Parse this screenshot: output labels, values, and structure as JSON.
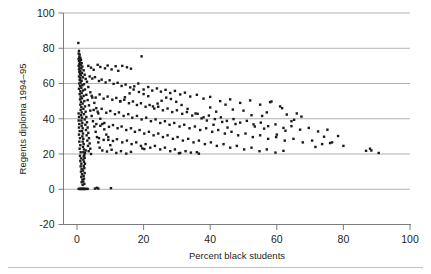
{
  "chart_data": {
    "type": "scatter",
    "title": "",
    "subtitle": "",
    "xlabel": "Percent black students",
    "ylabel": "Regents diploma 1994–95",
    "xlim": [
      -4,
      100
    ],
    "ylim": [
      -20,
      100
    ],
    "xticks": [
      0,
      20,
      40,
      60,
      80,
      100
    ],
    "yticks": [
      -20,
      0,
      20,
      40,
      60,
      80,
      100
    ],
    "xtick_labels": [
      "0",
      "20",
      "40",
      "60",
      "80",
      "100"
    ],
    "ytick_labels": [
      "-20",
      "0",
      "20",
      "40",
      "60",
      "80",
      "100"
    ],
    "gridlines_y": [
      0,
      20,
      40,
      60,
      80,
      100
    ],
    "grid": "horizontal",
    "legend": "none",
    "marker": "square",
    "marker_color": "#1a1a1a",
    "marker_size": 2.4,
    "n_points": 438,
    "points": [
      [
        0.4,
        83.0
      ],
      [
        0.6,
        78.5
      ],
      [
        0.5,
        77.0
      ],
      [
        0.8,
        76.4
      ],
      [
        0.7,
        75.2
      ],
      [
        1.0,
        74.6
      ],
      [
        0.5,
        74.0
      ],
      [
        1.2,
        73.4
      ],
      [
        0.6,
        72.8
      ],
      [
        0.9,
        72.0
      ],
      [
        1.4,
        71.5
      ],
      [
        0.7,
        71.0
      ],
      [
        1.1,
        70.4
      ],
      [
        0.5,
        70.0
      ],
      [
        1.6,
        69.6
      ],
      [
        0.8,
        69.0
      ],
      [
        1.3,
        68.5
      ],
      [
        0.6,
        68.0
      ],
      [
        2.0,
        67.5
      ],
      [
        1.0,
        67.0
      ],
      [
        0.7,
        66.6
      ],
      [
        1.5,
        66.0
      ],
      [
        0.9,
        65.5
      ],
      [
        2.3,
        65.0
      ],
      [
        1.2,
        64.6
      ],
      [
        0.6,
        64.0
      ],
      [
        1.8,
        63.5
      ],
      [
        1.0,
        63.0
      ],
      [
        2.6,
        62.6
      ],
      [
        0.8,
        62.0
      ],
      [
        1.4,
        61.6
      ],
      [
        3.0,
        61.0
      ],
      [
        1.1,
        60.6
      ],
      [
        0.7,
        60.0
      ],
      [
        2.1,
        59.6
      ],
      [
        1.6,
        59.0
      ],
      [
        0.9,
        58.6
      ],
      [
        3.4,
        58.0
      ],
      [
        1.3,
        57.6
      ],
      [
        0.6,
        57.0
      ],
      [
        2.4,
        56.6
      ],
      [
        1.8,
        56.0
      ],
      [
        1.0,
        55.6
      ],
      [
        4.0,
        55.0
      ],
      [
        1.4,
        54.6
      ],
      [
        0.8,
        54.0
      ],
      [
        2.8,
        53.6
      ],
      [
        2.0,
        53.0
      ],
      [
        1.1,
        52.6
      ],
      [
        4.6,
        52.0
      ],
      [
        1.5,
        51.6
      ],
      [
        0.9,
        51.0
      ],
      [
        3.2,
        50.6
      ],
      [
        2.2,
        50.0
      ],
      [
        1.2,
        49.6
      ],
      [
        5.2,
        49.0
      ],
      [
        1.7,
        48.6
      ],
      [
        1.0,
        48.0
      ],
      [
        3.6,
        47.6
      ],
      [
        2.4,
        47.0
      ],
      [
        1.3,
        46.6
      ],
      [
        5.8,
        46.0
      ],
      [
        1.9,
        45.6
      ],
      [
        1.1,
        45.0
      ],
      [
        4.0,
        44.6
      ],
      [
        2.6,
        44.0
      ],
      [
        1.4,
        43.6
      ],
      [
        6.4,
        43.0
      ],
      [
        2.1,
        42.6
      ],
      [
        1.2,
        42.0
      ],
      [
        4.4,
        41.6
      ],
      [
        2.8,
        41.0
      ],
      [
        1.5,
        40.6
      ],
      [
        7.0,
        40.0
      ],
      [
        2.3,
        39.6
      ],
      [
        1.3,
        39.0
      ],
      [
        4.8,
        38.6
      ],
      [
        3.0,
        38.0
      ],
      [
        1.6,
        37.6
      ],
      [
        7.6,
        37.0
      ],
      [
        2.5,
        36.6
      ],
      [
        1.4,
        36.0
      ],
      [
        5.2,
        35.6
      ],
      [
        3.2,
        35.0
      ],
      [
        1.7,
        34.6
      ],
      [
        8.2,
        34.0
      ],
      [
        2.7,
        33.6
      ],
      [
        1.5,
        33.0
      ],
      [
        5.6,
        32.6
      ],
      [
        3.4,
        32.0
      ],
      [
        1.8,
        31.6
      ],
      [
        8.8,
        31.0
      ],
      [
        2.9,
        30.6
      ],
      [
        1.6,
        30.0
      ],
      [
        6.0,
        29.6
      ],
      [
        3.6,
        29.0
      ],
      [
        1.9,
        28.6
      ],
      [
        9.4,
        28.0
      ],
      [
        3.1,
        27.6
      ],
      [
        1.7,
        27.0
      ],
      [
        6.4,
        26.6
      ],
      [
        3.8,
        26.0
      ],
      [
        2.0,
        25.6
      ],
      [
        10.0,
        25.0
      ],
      [
        3.3,
        24.6
      ],
      [
        1.8,
        24.0
      ],
      [
        6.8,
        23.6
      ],
      [
        4.0,
        23.0
      ],
      [
        2.1,
        22.6
      ],
      [
        2.6,
        22.0
      ],
      [
        3.5,
        21.6
      ],
      [
        1.9,
        21.0
      ],
      [
        2.4,
        20.6
      ],
      [
        4.2,
        20.0
      ],
      [
        2.2,
        19.4
      ],
      [
        2.0,
        18.6
      ],
      [
        2.3,
        17.8
      ],
      [
        1.9,
        16.8
      ],
      [
        2.1,
        15.6
      ],
      [
        2.4,
        14.4
      ],
      [
        2.0,
        13.2
      ],
      [
        2.2,
        12.0
      ],
      [
        1.8,
        10.6
      ],
      [
        2.3,
        9.2
      ],
      [
        2.0,
        7.6
      ],
      [
        2.1,
        6.0
      ],
      [
        1.9,
        4.4
      ],
      [
        2.2,
        3.0
      ],
      [
        0.8,
        0.2
      ],
      [
        1.2,
        0.2
      ],
      [
        1.6,
        0.2
      ],
      [
        2.0,
        0.2
      ],
      [
        2.4,
        0.2
      ],
      [
        2.8,
        0.2
      ],
      [
        3.2,
        0.2
      ],
      [
        5.4,
        0.4
      ],
      [
        6.0,
        0.8
      ],
      [
        6.4,
        0.4
      ],
      [
        10.2,
        0.6
      ],
      [
        0.5,
        0.2
      ],
      [
        1.0,
        0.2
      ],
      [
        1.4,
        0.2
      ],
      [
        1.8,
        0.2
      ],
      [
        2.2,
        0.2
      ],
      [
        0.5,
        43.0
      ],
      [
        0.6,
        41.0
      ],
      [
        0.5,
        39.0
      ],
      [
        0.7,
        37.0
      ],
      [
        0.6,
        35.0
      ],
      [
        0.8,
        33.0
      ],
      [
        0.6,
        31.0
      ],
      [
        0.9,
        29.0
      ],
      [
        0.7,
        27.0
      ],
      [
        1.0,
        25.0
      ],
      [
        0.8,
        23.0
      ],
      [
        1.1,
        21.0
      ],
      [
        0.9,
        19.0
      ],
      [
        1.2,
        17.5
      ],
      [
        1.0,
        16.0
      ],
      [
        1.3,
        14.5
      ],
      [
        1.1,
        13.0
      ],
      [
        1.4,
        11.5
      ],
      [
        1.2,
        10.0
      ],
      [
        1.5,
        8.5
      ],
      [
        1.3,
        7.0
      ],
      [
        1.6,
        5.5
      ],
      [
        1.4,
        4.0
      ],
      [
        1.7,
        2.5
      ],
      [
        3.4,
        70.0
      ],
      [
        4.2,
        69.0
      ],
      [
        5.0,
        67.8
      ],
      [
        6.2,
        70.6
      ],
      [
        7.0,
        69.4
      ],
      [
        8.4,
        68.6
      ],
      [
        9.2,
        70.2
      ],
      [
        10.4,
        68.0
      ],
      [
        11.6,
        69.8
      ],
      [
        12.4,
        67.2
      ],
      [
        13.6,
        70.0
      ],
      [
        15.0,
        69.2
      ],
      [
        16.2,
        68.4
      ],
      [
        19.4,
        75.4
      ],
      [
        3.8,
        64.0
      ],
      [
        4.6,
        62.8
      ],
      [
        5.4,
        63.6
      ],
      [
        6.6,
        61.4
      ],
      [
        7.4,
        62.2
      ],
      [
        8.6,
        60.6
      ],
      [
        9.8,
        61.8
      ],
      [
        11.0,
        59.8
      ],
      [
        12.2,
        60.4
      ],
      [
        13.4,
        58.6
      ],
      [
        14.6,
        59.4
      ],
      [
        16.0,
        57.8
      ],
      [
        17.2,
        58.4
      ],
      [
        18.4,
        60.0
      ],
      [
        20.0,
        56.6
      ],
      [
        21.4,
        58.0
      ],
      [
        22.6,
        56.0
      ],
      [
        24.0,
        57.2
      ],
      [
        25.2,
        55.4
      ],
      [
        26.6,
        56.4
      ],
      [
        28.0,
        54.6
      ],
      [
        29.4,
        55.8
      ],
      [
        31.0,
        53.8
      ],
      [
        32.4,
        54.8
      ],
      [
        34.0,
        52.6
      ],
      [
        36.0,
        53.6
      ],
      [
        38.0,
        51.4
      ],
      [
        40.0,
        52.4
      ],
      [
        43.0,
        50.0
      ],
      [
        46.0,
        51.0
      ],
      [
        49.0,
        49.0
      ],
      [
        52.0,
        50.4
      ],
      [
        55.0,
        48.0
      ],
      [
        58.0,
        49.4
      ],
      [
        61.0,
        47.0
      ],
      [
        4.4,
        53.0
      ],
      [
        5.6,
        52.0
      ],
      [
        6.8,
        53.8
      ],
      [
        8.0,
        51.4
      ],
      [
        9.2,
        52.6
      ],
      [
        10.6,
        50.8
      ],
      [
        11.8,
        51.8
      ],
      [
        13.0,
        49.8
      ],
      [
        14.2,
        50.8
      ],
      [
        15.6,
        48.8
      ],
      [
        16.8,
        49.8
      ],
      [
        18.0,
        47.8
      ],
      [
        19.2,
        48.8
      ],
      [
        20.6,
        46.8
      ],
      [
        21.8,
        47.8
      ],
      [
        23.2,
        45.8
      ],
      [
        24.4,
        46.8
      ],
      [
        25.8,
        44.8
      ],
      [
        27.2,
        45.8
      ],
      [
        28.6,
        43.8
      ],
      [
        30.0,
        44.8
      ],
      [
        31.6,
        42.8
      ],
      [
        33.0,
        43.8
      ],
      [
        34.6,
        41.8
      ],
      [
        36.2,
        42.8
      ],
      [
        38.0,
        40.8
      ],
      [
        39.6,
        41.8
      ],
      [
        41.4,
        39.8
      ],
      [
        43.2,
        40.8
      ],
      [
        45.0,
        38.8
      ],
      [
        47.0,
        39.8
      ],
      [
        49.0,
        37.8
      ],
      [
        51.0,
        38.8
      ],
      [
        53.0,
        36.8
      ],
      [
        55.2,
        37.8
      ],
      [
        57.4,
        35.8
      ],
      [
        59.6,
        36.8
      ],
      [
        62.0,
        34.8
      ],
      [
        64.4,
        35.8
      ],
      [
        67.0,
        33.8
      ],
      [
        69.6,
        34.8
      ],
      [
        72.4,
        32.8
      ],
      [
        75.2,
        33.8
      ],
      [
        5.0,
        45.0
      ],
      [
        6.2,
        44.0
      ],
      [
        7.4,
        45.6
      ],
      [
        8.8,
        43.4
      ],
      [
        10.0,
        44.4
      ],
      [
        11.4,
        42.6
      ],
      [
        12.6,
        43.6
      ],
      [
        14.0,
        41.6
      ],
      [
        15.4,
        42.6
      ],
      [
        16.6,
        40.6
      ],
      [
        18.0,
        41.6
      ],
      [
        19.4,
        39.6
      ],
      [
        20.8,
        40.6
      ],
      [
        22.2,
        38.6
      ],
      [
        23.6,
        39.6
      ],
      [
        25.0,
        37.6
      ],
      [
        26.4,
        38.6
      ],
      [
        27.8,
        36.6
      ],
      [
        29.2,
        37.6
      ],
      [
        30.8,
        35.6
      ],
      [
        32.2,
        36.6
      ],
      [
        33.8,
        34.6
      ],
      [
        35.4,
        35.6
      ],
      [
        37.0,
        33.6
      ],
      [
        38.8,
        34.6
      ],
      [
        40.6,
        32.6
      ],
      [
        42.4,
        33.6
      ],
      [
        44.4,
        31.6
      ],
      [
        46.4,
        32.6
      ],
      [
        48.4,
        30.6
      ],
      [
        50.6,
        31.6
      ],
      [
        52.8,
        29.6
      ],
      [
        55.0,
        30.6
      ],
      [
        57.4,
        28.6
      ],
      [
        59.8,
        29.6
      ],
      [
        62.4,
        27.6
      ],
      [
        65.0,
        28.6
      ],
      [
        67.8,
        26.6
      ],
      [
        70.6,
        27.6
      ],
      [
        73.6,
        25.6
      ],
      [
        76.6,
        26.6
      ],
      [
        80.0,
        24.6
      ],
      [
        5.8,
        37.0
      ],
      [
        7.0,
        36.0
      ],
      [
        8.2,
        37.6
      ],
      [
        9.6,
        35.4
      ],
      [
        10.8,
        36.4
      ],
      [
        12.2,
        34.6
      ],
      [
        13.4,
        35.6
      ],
      [
        14.8,
        33.6
      ],
      [
        16.2,
        34.6
      ],
      [
        17.4,
        32.6
      ],
      [
        18.8,
        33.6
      ],
      [
        20.2,
        31.6
      ],
      [
        21.6,
        32.6
      ],
      [
        23.0,
        30.6
      ],
      [
        24.4,
        31.6
      ],
      [
        25.8,
        29.6
      ],
      [
        27.2,
        30.6
      ],
      [
        28.8,
        28.6
      ],
      [
        30.2,
        29.6
      ],
      [
        31.8,
        27.6
      ],
      [
        33.4,
        28.6
      ],
      [
        35.0,
        26.6
      ],
      [
        36.6,
        27.6
      ],
      [
        38.4,
        25.6
      ],
      [
        40.2,
        26.6
      ],
      [
        42.0,
        24.6
      ],
      [
        44.0,
        25.6
      ],
      [
        46.0,
        23.6
      ],
      [
        48.0,
        24.6
      ],
      [
        50.2,
        22.6
      ],
      [
        52.4,
        23.6
      ],
      [
        54.8,
        21.6
      ],
      [
        57.0,
        22.6
      ],
      [
        59.6,
        20.8
      ],
      [
        62.0,
        21.8
      ],
      [
        6.6,
        29.0
      ],
      [
        8.0,
        28.0
      ],
      [
        9.4,
        29.6
      ],
      [
        10.8,
        27.4
      ],
      [
        12.0,
        28.4
      ],
      [
        13.6,
        26.6
      ],
      [
        15.0,
        27.6
      ],
      [
        16.4,
        25.6
      ],
      [
        17.8,
        26.6
      ],
      [
        19.2,
        24.6
      ],
      [
        20.6,
        25.6
      ],
      [
        22.0,
        23.6
      ],
      [
        23.4,
        24.6
      ],
      [
        25.0,
        22.6
      ],
      [
        26.4,
        23.6
      ],
      [
        28.0,
        21.6
      ],
      [
        29.4,
        22.6
      ],
      [
        31.0,
        20.6
      ],
      [
        32.6,
        21.6
      ],
      [
        34.2,
        20.8
      ],
      [
        36.0,
        21.0
      ],
      [
        7.6,
        22.0
      ],
      [
        9.0,
        21.4
      ],
      [
        10.4,
        22.4
      ],
      [
        11.8,
        20.6
      ],
      [
        13.2,
        21.6
      ],
      [
        14.8,
        20.2
      ],
      [
        16.2,
        21.2
      ],
      [
        19.6,
        23.2
      ],
      [
        20.2,
        22.8
      ],
      [
        30.6,
        20.4
      ],
      [
        36.6,
        20.2
      ],
      [
        40.0,
        46.4
      ],
      [
        41.8,
        44.0
      ],
      [
        44.6,
        48.0
      ],
      [
        46.8,
        45.2
      ],
      [
        50.0,
        44.6
      ],
      [
        52.4,
        42.0
      ],
      [
        55.6,
        41.6
      ],
      [
        57.0,
        43.6
      ],
      [
        58.4,
        49.8
      ],
      [
        61.6,
        46.0
      ],
      [
        63.0,
        42.4
      ],
      [
        64.4,
        38.6
      ],
      [
        65.2,
        39.4
      ],
      [
        66.0,
        43.0
      ],
      [
        67.4,
        41.2
      ],
      [
        71.6,
        24.0
      ],
      [
        74.2,
        29.8
      ],
      [
        76.0,
        26.2
      ],
      [
        78.4,
        30.2
      ],
      [
        86.8,
        21.8
      ],
      [
        88.4,
        22.0
      ],
      [
        90.6,
        20.6
      ],
      [
        88.0,
        23.0
      ],
      [
        60.0,
        31.0
      ],
      [
        62.6,
        33.2
      ],
      [
        56.2,
        34.4
      ],
      [
        53.4,
        35.6
      ],
      [
        47.6,
        37.0
      ],
      [
        45.2,
        35.0
      ],
      [
        43.6,
        38.2
      ],
      [
        41.0,
        36.6
      ],
      [
        39.0,
        39.0
      ],
      [
        37.4,
        40.2
      ],
      [
        35.6,
        43.0
      ],
      [
        33.2,
        45.6
      ],
      [
        31.4,
        47.8
      ],
      [
        29.8,
        49.6
      ],
      [
        28.2,
        51.2
      ],
      [
        26.8,
        52.0
      ],
      [
        25.4,
        50.2
      ],
      [
        24.2,
        48.6
      ],
      [
        22.8,
        47.0
      ],
      [
        21.4,
        52.8
      ],
      [
        20.0,
        54.0
      ],
      [
        18.6,
        55.2
      ],
      [
        17.0,
        56.6
      ],
      [
        15.8,
        54.4
      ],
      [
        14.4,
        52.2
      ],
      [
        13.0,
        50.0
      ]
    ]
  },
  "footer": {
    "rule": true
  }
}
